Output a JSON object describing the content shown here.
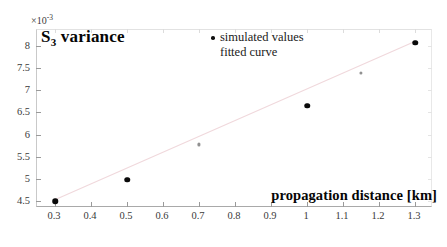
{
  "figure": {
    "title_in_plot": "S3 variance",
    "title_base": "S",
    "title_sub": "3",
    "title_rest": " variance",
    "exponent_prefix": "×10",
    "exponent_power": "-3",
    "xlabel": "propagation distance [km]",
    "background_color": "#ffffff",
    "axis_color": "#a9a9a9",
    "marker_color": "#0a0a0a",
    "fit_color": "#f0d8dc"
  },
  "legend": {
    "position": "top-center",
    "entries": [
      {
        "label": "simulated values",
        "marker": "dot-marker"
      },
      {
        "label": "fitted curve",
        "marker": "line-marker"
      }
    ]
  },
  "chart_data": {
    "type": "scatter",
    "title": "S3 variance",
    "xlabel": "propagation distance [km]",
    "ylabel": "S3 variance",
    "y_exponent": -3,
    "xlim": [
      0.25,
      1.35
    ],
    "ylim": [
      0.00435,
      0.00835
    ],
    "grid": false,
    "legend_position": "top-center",
    "xticks": [
      0.3,
      0.4,
      0.5,
      0.6,
      0.7,
      0.8,
      0.9,
      1,
      1.1,
      1.2,
      1.3
    ],
    "xticklabels": [
      "0.3",
      "0.4",
      "0.5",
      "0.6",
      "0.7",
      "0.8",
      "0.9",
      "1",
      "1.1",
      "1.2",
      "1.3"
    ],
    "yticks": [
      0.0045,
      0.005,
      0.0055,
      0.006,
      0.0065,
      0.007,
      0.0075,
      0.008
    ],
    "yticklabels": [
      "4.5",
      "5",
      "5.5",
      "6",
      "6.5",
      "7",
      "7.5",
      "8"
    ],
    "series": [
      {
        "name": "simulated values",
        "type": "scatter",
        "x": [
          0.3,
          0.5,
          0.7,
          1.0,
          1.15,
          1.3
        ],
        "y": [
          0.0045,
          0.00499,
          0.00578,
          0.00665,
          0.00738,
          0.00806
        ]
      },
      {
        "name": "fitted curve",
        "type": "line",
        "x": [
          0.3,
          1.3
        ],
        "y": [
          0.00449,
          0.00807
        ]
      }
    ]
  }
}
